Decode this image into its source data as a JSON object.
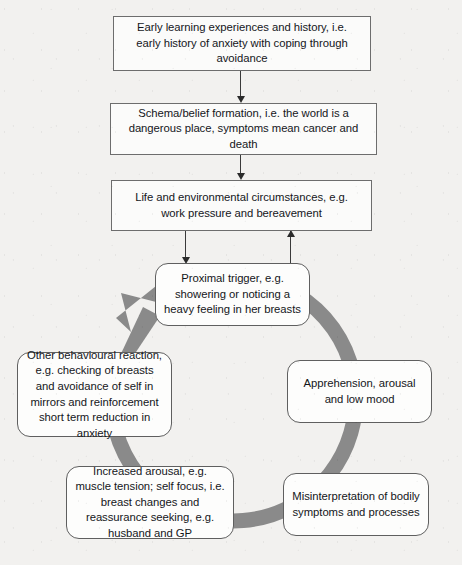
{
  "diagram": {
    "type": "cbt-vicious-cycle-formulation",
    "background_color": "#f2f1ef",
    "cycle_arrow_color": "#8a8a8a",
    "box_border_color": "#6d6d6d",
    "top_chain": [
      {
        "id": "early-learning",
        "shape": "rectangle",
        "text": "Early learning experiences and history, i.e. early history of anxiety with coping through avoidance"
      },
      {
        "id": "schema-belief",
        "shape": "rectangle",
        "text": "Schema/belief formation, i.e. the world is a dangerous place, symptoms mean cancer and death"
      },
      {
        "id": "life-circumstances",
        "shape": "rectangle",
        "text": "Life and environmental circumstances, e.g. work pressure and bereavement"
      }
    ],
    "cycle_nodes": [
      {
        "id": "proximal-trigger",
        "shape": "rounded",
        "position": "top",
        "text": "Proximal trigger, e.g. showering or noticing a heavy feeling in her breasts"
      },
      {
        "id": "apprehension",
        "shape": "rounded",
        "position": "right",
        "text": "Apprehension, arousal and low mood"
      },
      {
        "id": "misinterpretation",
        "shape": "rounded",
        "position": "bottom-right",
        "text": "Misinterpretation of bodily symptoms and processes"
      },
      {
        "id": "increased-arousal",
        "shape": "rounded",
        "position": "bottom-left",
        "text": "Increased arousal, e.g. muscle tension; self focus, i.e. breast changes and reassurance seeking, e.g. husband and GP"
      },
      {
        "id": "other-behavioural-reaction",
        "shape": "rounded",
        "position": "left",
        "text": "Other behavioural reaction, e.g. checking of breasts and avoidance of self in mirrors and reinforcement short term reduction in anxiety"
      }
    ],
    "connectors": [
      {
        "id": "early-to-schema",
        "from": "early-learning",
        "to": "schema-belief",
        "direction": "down"
      },
      {
        "id": "schema-to-life",
        "from": "schema-belief",
        "to": "life-circumstances",
        "direction": "down"
      },
      {
        "id": "life-to-trigger",
        "from": "life-circumstances",
        "to": "proximal-trigger",
        "direction": "down"
      },
      {
        "id": "cycle-to-life",
        "from": "cycle",
        "to": "life-circumstances",
        "direction": "up"
      },
      {
        "id": "vicious-cycle",
        "from": "other-behavioural-reaction",
        "to": "proximal-trigger",
        "direction": "clockwise-loop"
      }
    ]
  }
}
